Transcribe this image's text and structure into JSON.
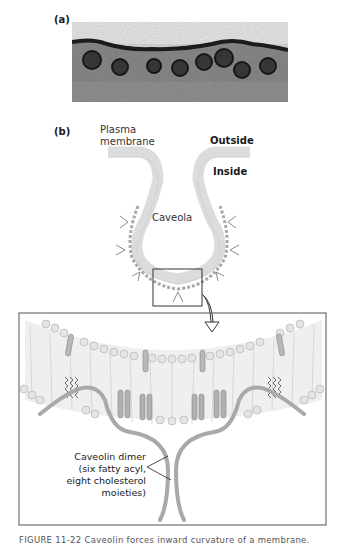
{
  "panel_a": {
    "label": "(a)",
    "image_desc": "electron micrograph of caveolae at plasma membrane"
  },
  "panel_b": {
    "label": "(b)",
    "plasma_membrane_label_line1": "Plasma",
    "plasma_membrane_label_line2": "membrane",
    "outside_label": "Outside",
    "inside_label": "Inside",
    "caveola_label": "Caveola",
    "callout": {
      "line1": "Caveolin dimer",
      "line2": "(six fatty acyl,",
      "line3": "eight cholesterol",
      "line4": "moieties)"
    }
  },
  "caption": {
    "text": "FIGURE 11-22 Caveolin forces inward curvature of a membrane."
  },
  "colors": {
    "membrane": "#dcdcdc",
    "protein": "#a9a9a9",
    "frame": "#555555"
  }
}
